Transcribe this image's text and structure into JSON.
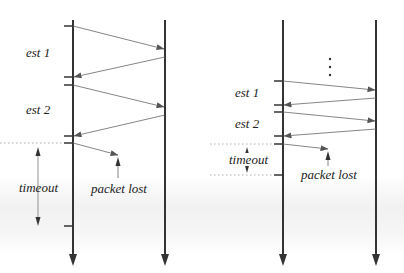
{
  "diagrams": [
    {
      "id": "left",
      "labels": {
        "est1": "est 1",
        "est2": "est 2",
        "timeout": "timeout",
        "packet_lost": "packet lost"
      }
    },
    {
      "id": "right",
      "labels": {
        "ellipsis": "⋮",
        "est1": "est 1",
        "est2": "est 2",
        "timeout": "timeout",
        "packet_lost": "packet lost"
      }
    }
  ],
  "colors": {
    "timeline": "#333333",
    "message": "#666666",
    "dotted": "#999999",
    "text": "#222222"
  }
}
